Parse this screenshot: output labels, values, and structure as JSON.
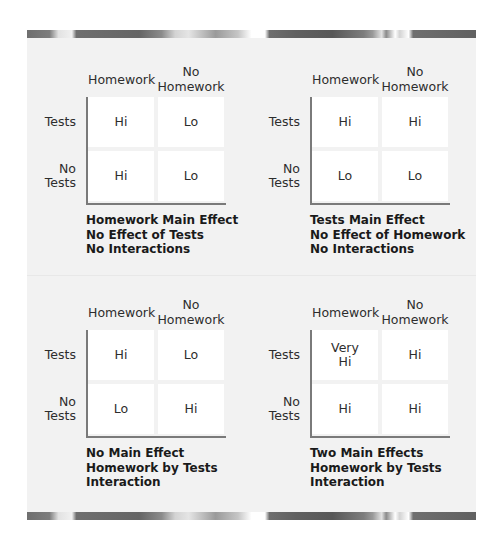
{
  "colors": {
    "panel_background": "#f2f2f2",
    "cell_background": "#ffffff",
    "axis_line": "#7a7a7a",
    "text": "#2d2d2d"
  },
  "column_headers": {
    "homework": "Homework",
    "no_homework_line1": "No",
    "no_homework_line2": "Homework"
  },
  "row_headers": {
    "tests": "Tests",
    "no_tests_line1": "No",
    "no_tests_line2": "Tests"
  },
  "panels": [
    {
      "cells": {
        "tests_homework": [
          "Hi"
        ],
        "tests_no_homework": [
          "Lo"
        ],
        "no_tests_homework": [
          "Hi"
        ],
        "no_tests_no_homework": [
          "Lo"
        ]
      },
      "caption": [
        "Homework Main Effect",
        "No Effect of Tests",
        "No Interactions"
      ]
    },
    {
      "cells": {
        "tests_homework": [
          "Hi"
        ],
        "tests_no_homework": [
          "Hi"
        ],
        "no_tests_homework": [
          "Lo"
        ],
        "no_tests_no_homework": [
          "Lo"
        ]
      },
      "caption": [
        "Tests Main Effect",
        "No Effect of Homework",
        "No Interactions"
      ]
    },
    {
      "cells": {
        "tests_homework": [
          "Hi"
        ],
        "tests_no_homework": [
          "Lo"
        ],
        "no_tests_homework": [
          "Lo"
        ],
        "no_tests_no_homework": [
          "Hi"
        ]
      },
      "caption": [
        "No Main Effect",
        "Homework by Tests",
        "Interaction"
      ]
    },
    {
      "cells": {
        "tests_homework": [
          "Very",
          "Hi"
        ],
        "tests_no_homework": [
          "Hi"
        ],
        "no_tests_homework": [
          "Hi"
        ],
        "no_tests_no_homework": [
          "Hi"
        ]
      },
      "caption": [
        "Two Main Effects",
        "Homework by Tests",
        "Interaction"
      ]
    }
  ]
}
